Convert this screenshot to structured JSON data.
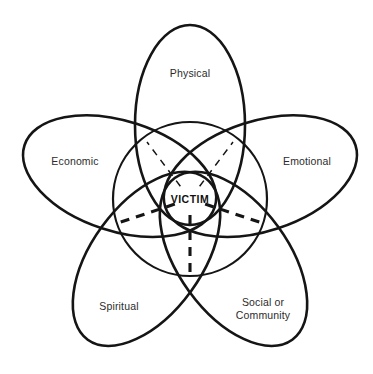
{
  "diagram": {
    "type": "petal-venn",
    "center": {
      "label": "VICTIM",
      "cx": 190,
      "cy": 199,
      "radius": 77
    },
    "stroke_color": "#151515",
    "text_color": "#2b2b2b",
    "background_color": "#ffffff",
    "petals": [
      {
        "id": "physical",
        "label": "Physical",
        "angle_deg": 90,
        "label_x": 190,
        "label_y": 73,
        "semi_major": 100,
        "semi_minor": 55
      },
      {
        "id": "economic",
        "label": "Economic",
        "angle_deg": 162,
        "label_x": 75,
        "label_y": 161,
        "semi_major": 100,
        "semi_minor": 55
      },
      {
        "id": "emotional",
        "label": "Emotional",
        "angle_deg": 18,
        "label_x": 307,
        "label_y": 161,
        "semi_major": 100,
        "semi_minor": 55
      },
      {
        "id": "spiritual",
        "label": "Spiritual",
        "angle_deg": 234,
        "label_x": 119,
        "label_y": 306,
        "semi_major": 100,
        "semi_minor": 55
      },
      {
        "id": "social-or-community",
        "label": "Social or\nCommunity",
        "angle_deg": 306,
        "label_x": 263,
        "label_y": 308,
        "semi_major": 100,
        "semi_minor": 55
      }
    ],
    "spokes": [
      {
        "id": "spoke-upper-left",
        "to_x": 147,
        "to_y": 142,
        "style": "dashed-thin"
      },
      {
        "id": "spoke-upper-right",
        "to_x": 233,
        "to_y": 142,
        "style": "dashed-thin"
      },
      {
        "id": "spoke-left",
        "to_x": 118,
        "to_y": 223,
        "style": "dashed-thick"
      },
      {
        "id": "spoke-right",
        "to_x": 262,
        "to_y": 223,
        "style": "dashed-thick"
      },
      {
        "id": "spoke-bottom",
        "to_x": 190,
        "to_y": 277,
        "style": "dashed-thick"
      }
    ]
  }
}
